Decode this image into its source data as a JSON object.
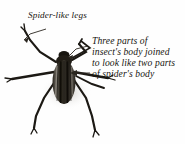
{
  "figure": {
    "kind": "labelled-illustration",
    "background_color": "#fefefe",
    "ink_color": "#1a1712"
  },
  "annotations": {
    "legs_label": "Spider-like legs",
    "body_note_lines": [
      "Three parts of",
      "insect's body joined",
      "to look like two parts",
      "of spider's body"
    ]
  },
  "illustration": {
    "body_color": "#15120e",
    "body_highlight": "#6d6962",
    "leg_color": "#1c1914",
    "shadow_color": "#b9b5ad",
    "leg_count": 6,
    "antenna_count": 2
  }
}
